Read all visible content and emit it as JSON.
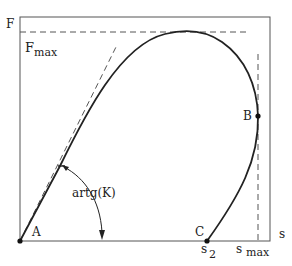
{
  "diagram": {
    "type": "force-displacement curve",
    "axes": {
      "y_label": "F",
      "x_label": "s"
    },
    "labels": {
      "f_max": "F",
      "f_max_sub": "max",
      "point_a": "A",
      "point_b": "B",
      "point_c": "C",
      "s2": "s",
      "s2_sub": "2",
      "s_max": "s",
      "s_max_sub": "max",
      "angle": "artg(K)"
    },
    "colors": {
      "line": "#222222",
      "dashed": "#555555",
      "background": "#ffffff"
    }
  }
}
